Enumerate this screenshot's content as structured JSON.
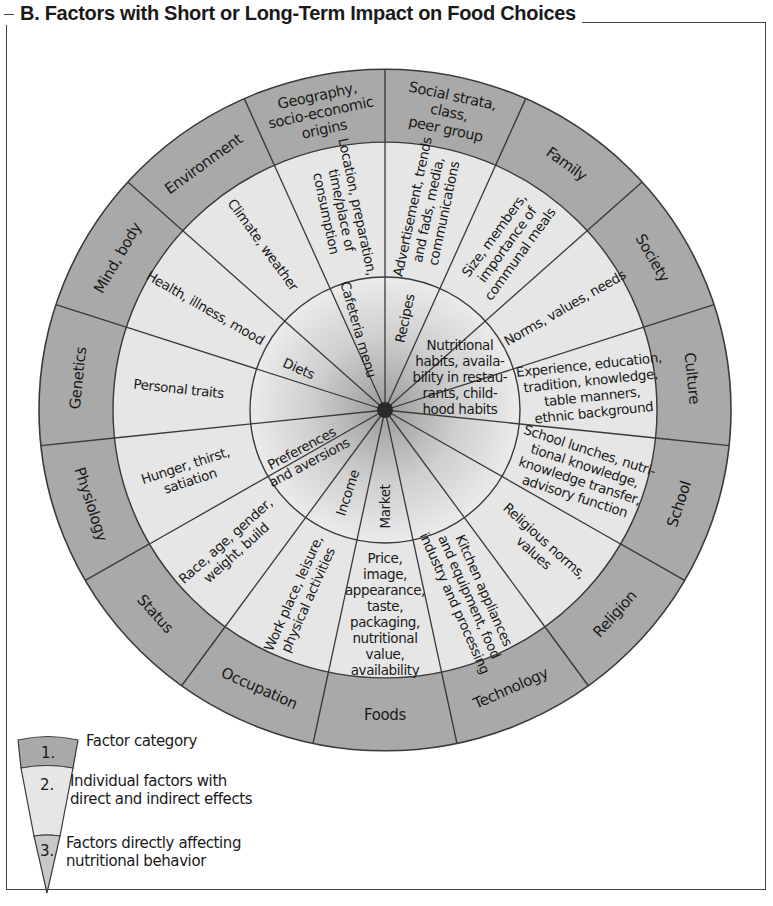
{
  "title": "B. Factors with Short or Long-Term Impact on Food Choices",
  "colors": {
    "outer_ring": "#a9a9a9",
    "middle_ring": "#e6e6e6",
    "inner_circle_center": "#9a9a9a",
    "inner_circle_edge": "#ebebeb",
    "line": "#3a3a3a",
    "frame": "#444444"
  },
  "wheel": {
    "categories": [
      {
        "label": "Social strata,\nclass,\npeer group",
        "factors": "Advertisement, trends\nand fads, media,\ncommunications"
      },
      {
        "label": "Family",
        "factors": "Size, members,\nimportance of\ncommunal meals"
      },
      {
        "label": "Society",
        "factors": "Norms, values, needs"
      },
      {
        "label": "Culture",
        "factors": "Experience, education,\ntradition, knowledge,\ntable manners,\nethnic background"
      },
      {
        "label": "School",
        "factors": "School lunches, nutri-\ntional knowledge,\nknowledge transfer,\nadvisory function"
      },
      {
        "label": "Religion",
        "factors": "Religious norms,\nvalues"
      },
      {
        "label": "Technology",
        "factors": "Kitchen appliances\nand equipment, food\nindustry and processing"
      },
      {
        "label": "Foods",
        "factors": "Price,\nimage,\nappearance,\ntaste,\npackaging,\nnutritional\nvalue,\navailability"
      },
      {
        "label": "Occupation",
        "factors": "Work place, leisure,\nphysical activities"
      },
      {
        "label": "Status",
        "factors": "Race, age, gender,\nweight, build"
      },
      {
        "label": "Physiology",
        "factors": "Hunger, thirst,\nsatiation"
      },
      {
        "label": "Genetics",
        "factors": "Personal traits"
      },
      {
        "label": "Mind, body",
        "factors": "Health, illness, mood"
      },
      {
        "label": "Environment",
        "factors": "Climate, weather"
      },
      {
        "label": "Geography,\nsocio-economic\norigins",
        "factors": "Location, preparation,\ntime/place of\nconsumption"
      }
    ],
    "inner_factors": [
      {
        "label": "Recipes"
      },
      {
        "label": "Nutritional\nhabits, availa-\nbility in restau-\nrants, child-\nhood habits"
      },
      {
        "label": "Market"
      },
      {
        "label": "Income"
      },
      {
        "label": "Preferences\nand aversions"
      },
      {
        "label": "Diets"
      },
      {
        "label": "Cafeteria menu"
      }
    ]
  },
  "legend": {
    "items": [
      {
        "number": "1.",
        "text": "Factor category"
      },
      {
        "number": "2.",
        "text": "Individual factors with\ndirect and indirect effects"
      },
      {
        "number": "3.",
        "text": "Factors directly affecting\nnutritional behavior"
      }
    ]
  }
}
